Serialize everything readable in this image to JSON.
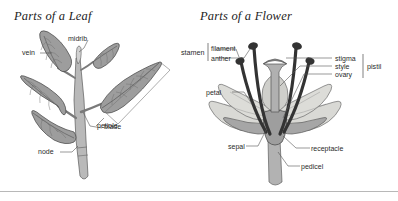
{
  "figures": [
    {
      "id": "leaf",
      "title": "Parts of a Leaf",
      "labels": [
        {
          "key": "vein",
          "text": "vein"
        },
        {
          "key": "midrib",
          "text": "midrib"
        },
        {
          "key": "blade",
          "text": "blade"
        },
        {
          "key": "petiole",
          "text": "petiole"
        },
        {
          "key": "node",
          "text": "node"
        }
      ]
    },
    {
      "id": "flower",
      "title": "Parts of a Flower",
      "labels": [
        {
          "key": "stamen",
          "text": "stamen"
        },
        {
          "key": "filament",
          "text": "filament"
        },
        {
          "key": "anther",
          "text": "anther"
        },
        {
          "key": "stigma",
          "text": "stigma"
        },
        {
          "key": "style",
          "text": "style"
        },
        {
          "key": "ovary",
          "text": "ovary"
        },
        {
          "key": "pistil",
          "text": "pistil"
        },
        {
          "key": "petal",
          "text": "petal"
        },
        {
          "key": "sepal",
          "text": "sepal"
        },
        {
          "key": "receptacle",
          "text": "receptacle"
        },
        {
          "key": "pedicel",
          "text": "pedicel"
        }
      ]
    }
  ],
  "colors": {
    "background": "#ffffff",
    "border": "#b8b8b8",
    "text": "#2a2a2a",
    "leader_line": "#555555",
    "leaf_fill": "#9a9a9a",
    "leaf_outline": "#4a4a4a",
    "stem_fill": "#b5b5b5",
    "petal_fill": "#d6d6d2",
    "petal_outline": "#6b6b6b",
    "sepal_fill": "#a8a8a8",
    "stamen_dark": "#3a3a3a",
    "ovary_fill": "#a0a0a0",
    "pedicel_fill": "#b0b0b0"
  }
}
